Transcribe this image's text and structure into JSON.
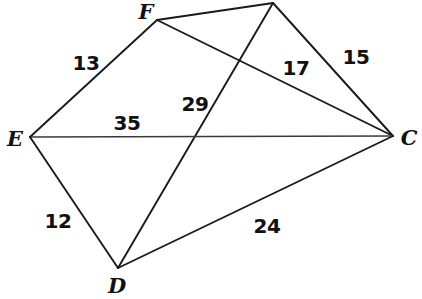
{
  "figure": {
    "type": "geometry-diagram",
    "width": 422,
    "height": 299,
    "background_color": "#ffffff",
    "stroke_color": "#1a1a1a",
    "text_color": "#111111",
    "vertices": [
      {
        "id": "F",
        "label": "F",
        "x": 157,
        "y": 20,
        "label_x": 146,
        "label_y": 11,
        "visible_label": true
      },
      {
        "id": "G",
        "label": "",
        "x": 273,
        "y": 3,
        "label_x": 214,
        "label_y": 2,
        "visible_label": false
      },
      {
        "id": "E",
        "label": "E",
        "x": 30,
        "y": 137,
        "label_x": 15,
        "label_y": 138,
        "visible_label": true
      },
      {
        "id": "C",
        "label": "C",
        "x": 393,
        "y": 136,
        "label_x": 409,
        "label_y": 137,
        "visible_label": true
      },
      {
        "id": "D",
        "label": "D",
        "x": 118,
        "y": 268,
        "label_x": 117,
        "label_y": 285,
        "visible_label": true
      }
    ],
    "edges": [
      {
        "id": "EF",
        "from": "E",
        "to": "F",
        "length": "13"
      },
      {
        "id": "FG",
        "from": "F",
        "to": "G",
        "length": ""
      },
      {
        "id": "GC",
        "from": "G",
        "to": "C",
        "length": "15"
      },
      {
        "id": "FC",
        "from": "F",
        "to": "C",
        "length": "17"
      },
      {
        "id": "DG",
        "from": "D",
        "to": "G",
        "length": "29"
      },
      {
        "id": "EC",
        "from": "E",
        "to": "C",
        "length": "35"
      },
      {
        "id": "ED",
        "from": "E",
        "to": "D",
        "length": "12"
      },
      {
        "id": "DC",
        "from": "D",
        "to": "C",
        "length": "24"
      }
    ],
    "length_labels": [
      {
        "id": "len-13",
        "edge": "EF",
        "text": "13",
        "x": 86,
        "y": 63
      },
      {
        "id": "len-17",
        "edge": "FC",
        "text": "17",
        "x": 296,
        "y": 68
      },
      {
        "id": "len-15",
        "edge": "GC",
        "text": "15",
        "x": 356,
        "y": 57
      },
      {
        "id": "len-29",
        "edge": "DG",
        "text": "29",
        "x": 195,
        "y": 104
      },
      {
        "id": "len-35",
        "edge": "EC",
        "text": "35",
        "x": 127,
        "y": 123
      },
      {
        "id": "len-12",
        "edge": "ED",
        "text": "12",
        "x": 58,
        "y": 221
      },
      {
        "id": "len-24",
        "edge": "DC",
        "text": "24",
        "x": 267,
        "y": 226
      }
    ]
  }
}
